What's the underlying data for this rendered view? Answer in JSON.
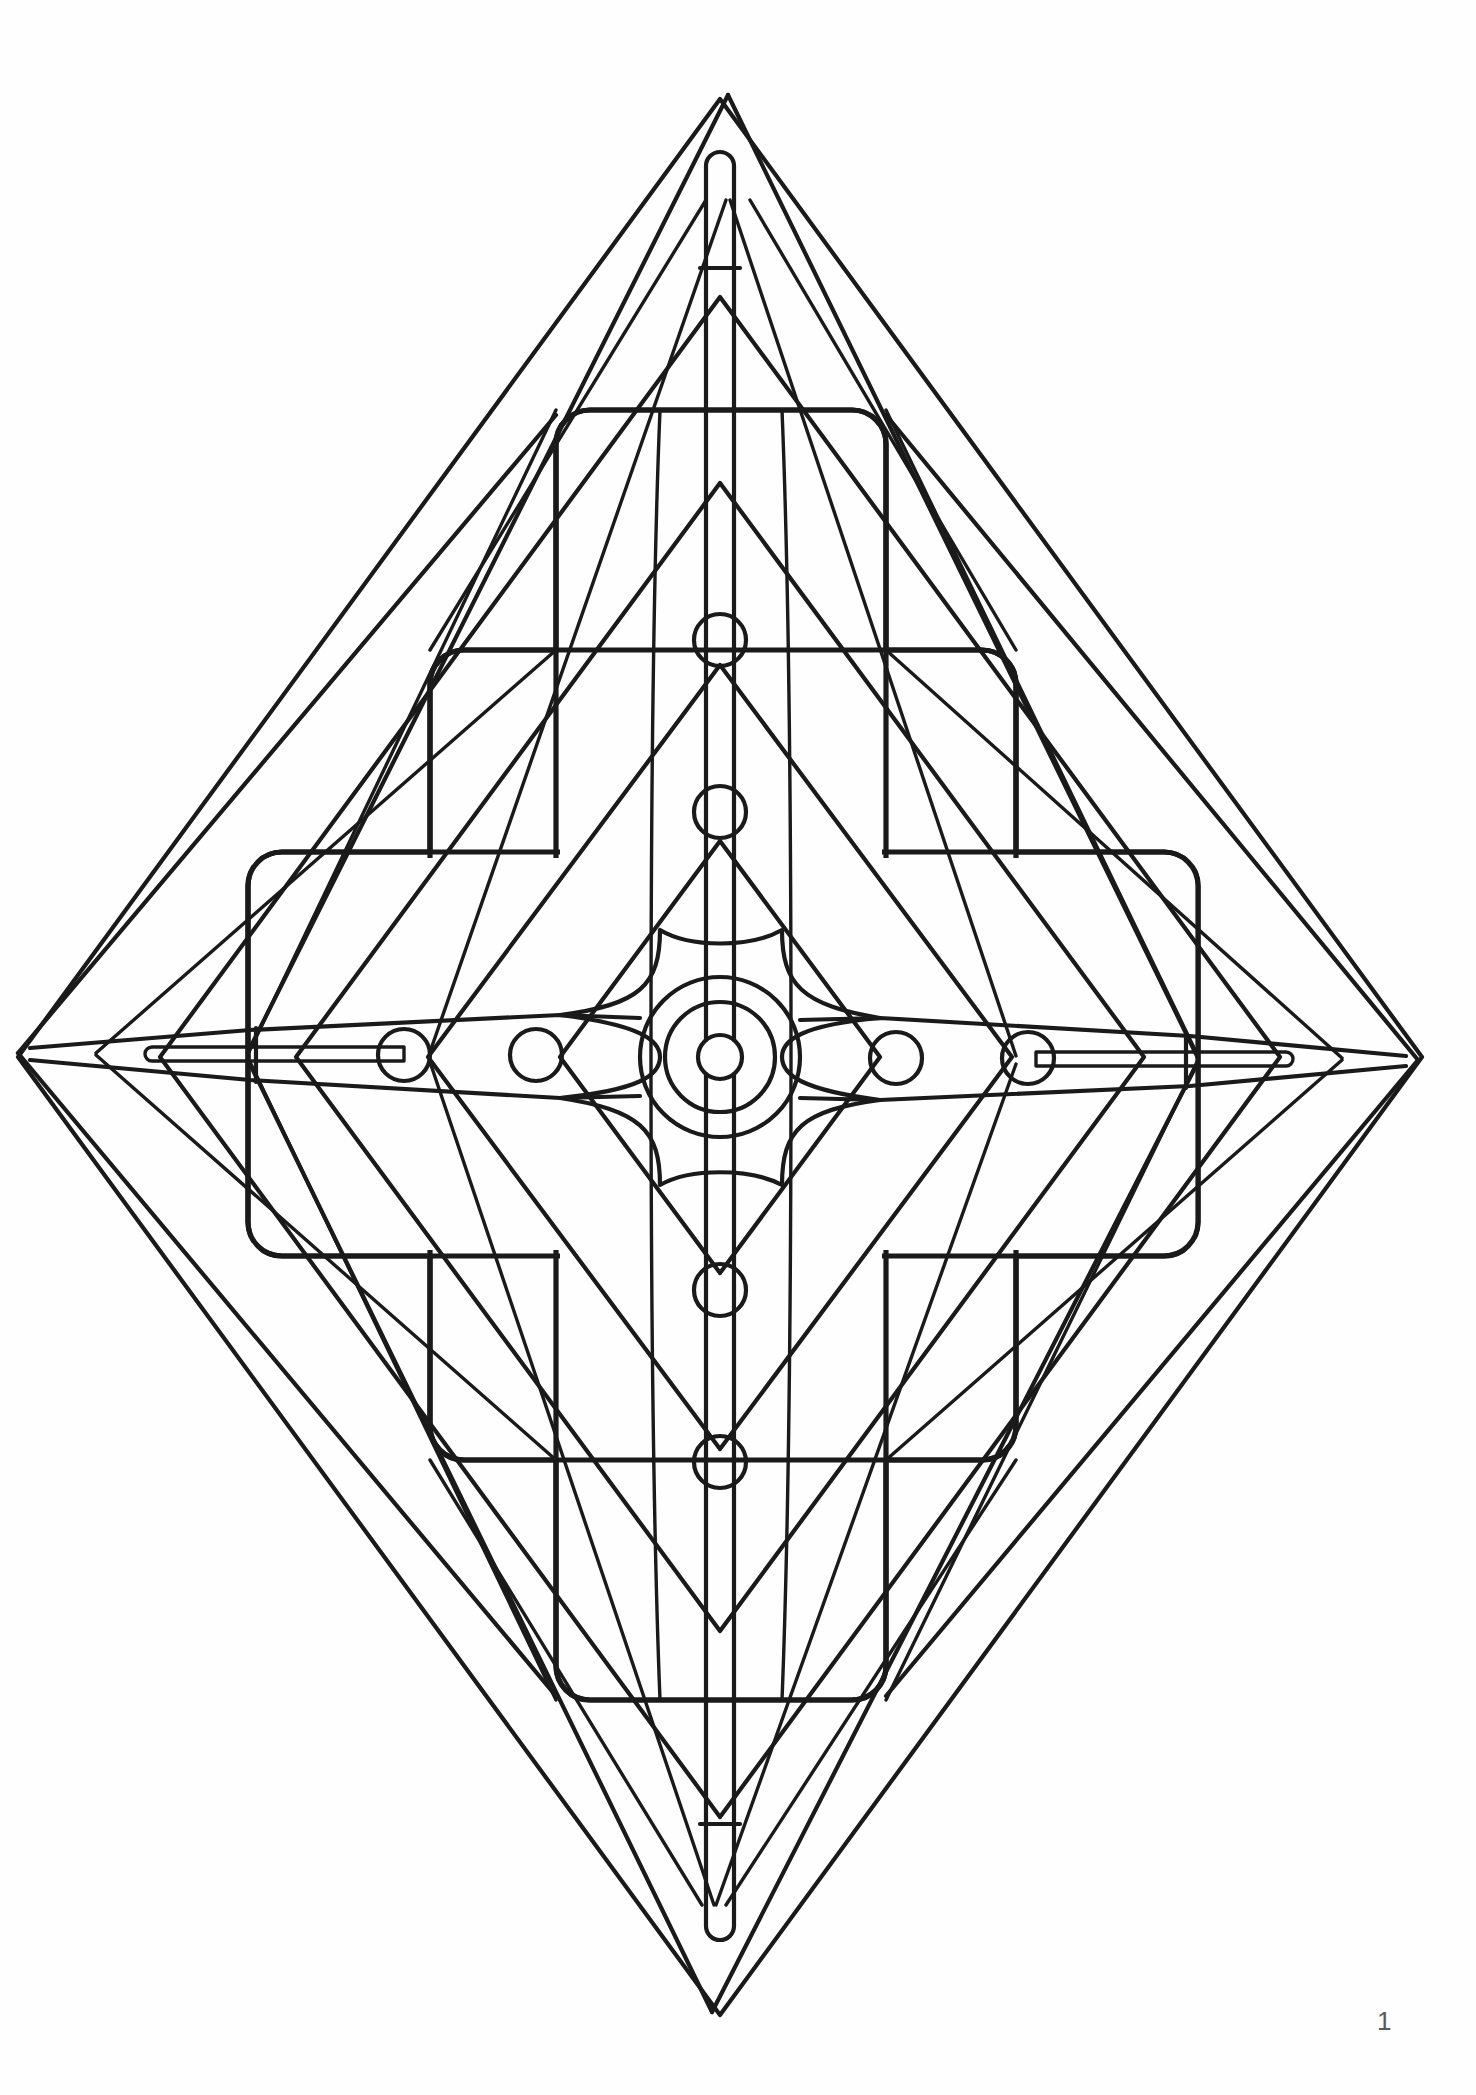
{
  "document": {
    "type": "coloring-book-page",
    "title": "Geometric Star Mandala",
    "page_number": "1",
    "background_color": "#fefefe",
    "ink_color": "#1a1a1a",
    "canvas": {
      "width": 1476,
      "height": 2095
    }
  },
  "artwork": {
    "name": "four-pointed-star-mandala",
    "description": "Symmetric line-art mandala: a tall four-pointed star with nested diamonds, stepped rounded-square frames and circular nodes.",
    "center": {
      "x": 720,
      "y": 1057
    },
    "tips": {
      "top": {
        "x": 728,
        "y": 95
      },
      "bottom": {
        "x": 712,
        "y": 2012
      },
      "left": {
        "x": 18,
        "y": 1053
      },
      "right": {
        "x": 1418,
        "y": 1060
      }
    },
    "concentric_circles": {
      "name": "center-rosette",
      "center": {
        "x": 720,
        "y": 1057
      },
      "radii": [
        80,
        55,
        22
      ]
    },
    "node_circles": {
      "radius": 26,
      "vertical": [
        {
          "x": 720,
          "y": 640
        },
        {
          "x": 720,
          "y": 812
        },
        {
          "x": 720,
          "y": 1290
        },
        {
          "x": 720,
          "y": 1462
        }
      ],
      "horizontal": [
        {
          "x": 404,
          "y": 1055
        },
        {
          "x": 536,
          "y": 1055
        },
        {
          "x": 896,
          "y": 1058
        },
        {
          "x": 1028,
          "y": 1058
        }
      ]
    },
    "rounded_frames": [
      {
        "name": "frame-outer-vertical",
        "x": 556,
        "y": 410,
        "w": 330,
        "h": 1290,
        "r": 34
      },
      {
        "name": "frame-middle",
        "x": 430,
        "y": 650,
        "w": 586,
        "h": 810,
        "r": 34
      },
      {
        "name": "frame-inner-horizontal",
        "x": 248,
        "y": 852,
        "w": 950,
        "h": 404,
        "r": 34
      }
    ],
    "diamonds": [
      {
        "name": "diamond-outermost",
        "half_w": 702,
        "half_h": 958
      },
      {
        "name": "diamond-outer",
        "half_w": 560,
        "half_h": 760
      },
      {
        "name": "diamond-mid",
        "half_w": 424,
        "half_h": 574
      },
      {
        "name": "diamond-inner",
        "half_w": 292,
        "half_h": 392
      },
      {
        "name": "diamond-innermost",
        "half_w": 160,
        "half_h": 216
      }
    ],
    "spine": {
      "name": "central-spine-slots",
      "half_width": 14,
      "top_slot": {
        "y_top": 148,
        "y_bottom": 1040
      },
      "bottom_slot": {
        "y_top": 1075,
        "y_bottom": 1940
      }
    }
  },
  "footer": {
    "page_label": "1"
  }
}
